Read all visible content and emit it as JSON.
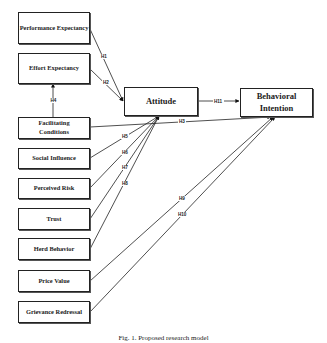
{
  "figure": {
    "caption": "Fig. 1. Proposed research model",
    "constructs": {
      "performance_expectancy": "Performance Expectancy",
      "effort_expectancy": "Effort Expectancy",
      "facilitating_conditions": "Facilitating Conditions",
      "social_influence": "Social Influence",
      "perceived_risk": "Perceived Risk",
      "trust": "Trust",
      "herd_behavior": "Herd Behavior",
      "price_value": "Price Value",
      "grievance_redressal": "Grievance Redressal",
      "attitude": "Attitude",
      "behavioral_intention": "Behavioral Intention"
    },
    "hypotheses": {
      "h1": "H1",
      "h2": "H2",
      "h3": "H3",
      "h4": "H4",
      "h5": "H5",
      "h6": "H6",
      "h7": "H7",
      "h8": "H8",
      "h9": "H9",
      "h10": "H10",
      "h11": "H11"
    },
    "paths": [
      {
        "id": "H1",
        "from": "Performance Expectancy",
        "to": "Attitude"
      },
      {
        "id": "H2",
        "from": "Effort Expectancy",
        "to": "Attitude"
      },
      {
        "id": "H3",
        "from": "Facilitating Conditions",
        "to": "Behavioral Intention"
      },
      {
        "id": "H4",
        "from": "Facilitating Conditions",
        "to": "Effort Expectancy"
      },
      {
        "id": "H5",
        "from": "Social Influence",
        "to": "Attitude"
      },
      {
        "id": "H6",
        "from": "Perceived Risk",
        "to": "Attitude"
      },
      {
        "id": "H7",
        "from": "Trust",
        "to": "Attitude"
      },
      {
        "id": "H8",
        "from": "Herd Behavior",
        "to": "Attitude"
      },
      {
        "id": "H9",
        "from": "Price Value",
        "to": "Behavioral Intention"
      },
      {
        "id": "H10",
        "from": "Grievance Redressal",
        "to": "Behavioral Intention"
      },
      {
        "id": "H11",
        "from": "Attitude",
        "to": "Behavioral Intention"
      }
    ]
  }
}
